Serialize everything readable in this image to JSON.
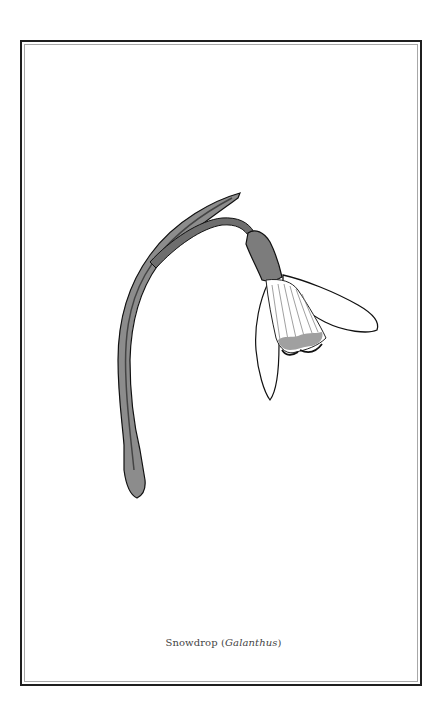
{
  "page": {
    "frame": {
      "outer_color": "#1f1f1f",
      "inner_color": "#a8a8a8"
    },
    "illustration": {
      "subject": "snowdrop-flower-drawing",
      "colors": {
        "stem": "#7a7a7a",
        "leaf": "#8c8c8c",
        "outline": "#111111",
        "petal": "#ffffff",
        "marking": "#a0a0a0"
      }
    },
    "caption": {
      "common_name": "Snowdrop",
      "open_paren": " (",
      "scientific_name": "Galanthus",
      "close_paren": ")"
    }
  }
}
